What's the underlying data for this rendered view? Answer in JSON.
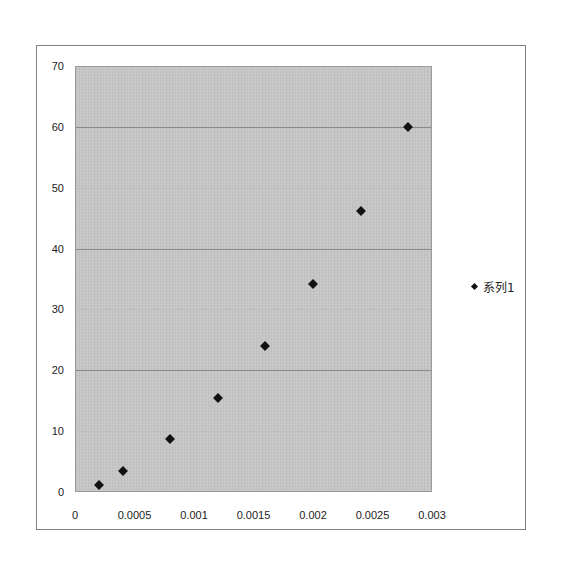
{
  "chart_data": {
    "type": "scatter",
    "title": "",
    "xlabel": "",
    "ylabel": "",
    "xlim": [
      0,
      0.003
    ],
    "ylim": [
      0,
      70
    ],
    "x_ticks": [
      "0",
      "0.0005",
      "0.001",
      "0.0015",
      "0.002",
      "0.0025",
      "0.003"
    ],
    "y_ticks": [
      "0",
      "10",
      "20",
      "30",
      "40",
      "50",
      "60",
      "70"
    ],
    "grid": true,
    "legend_position": "right",
    "series": [
      {
        "name": "系列1",
        "marker": "diamond",
        "color": "#111111",
        "x": [
          0.0002,
          0.0004,
          0.0008,
          0.0012,
          0.0016,
          0.002,
          0.0024,
          0.0028
        ],
        "y": [
          1.2,
          3.5,
          8.7,
          15.4,
          24.0,
          34.2,
          46.1,
          59.9
        ]
      }
    ]
  },
  "legend": {
    "label": "系列1"
  },
  "colors": {
    "plot_background": "#c6c6c6",
    "marker": "#111111",
    "frame": "#808080"
  }
}
